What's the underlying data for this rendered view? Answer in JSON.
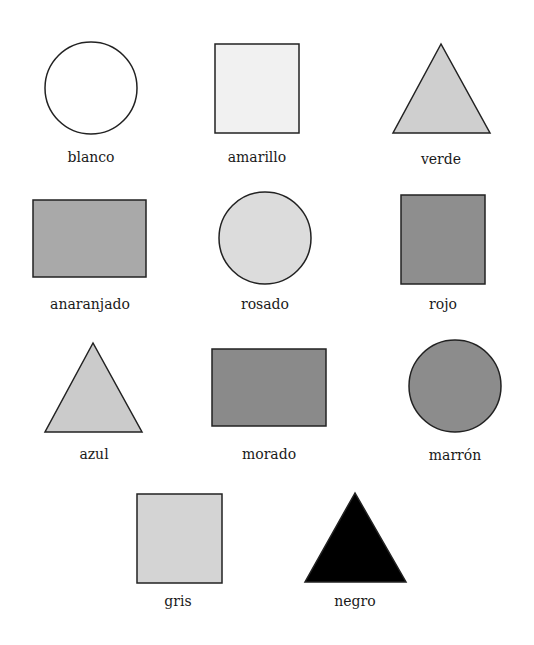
{
  "shapes": [
    {
      "label": "blanco",
      "shape": "circle",
      "fill": "#ffffff",
      "cx": 91,
      "cy": 88,
      "r": 46,
      "label_x": 91,
      "label_y": 149
    },
    {
      "label": "amarillo",
      "shape": "square",
      "fill": "#f1f1f1",
      "x": 215,
      "y": 44,
      "w": 84,
      "h": 89,
      "label_x": 257,
      "label_y": 149
    },
    {
      "label": "verde",
      "shape": "triangle",
      "fill": "#cfcfcf",
      "points": "441,44 393,133 490,133",
      "label_x": 441,
      "label_y": 151
    },
    {
      "label": "anaranjado",
      "shape": "rectangle",
      "fill": "#a9a9a9",
      "x": 33,
      "y": 200,
      "w": 113,
      "h": 77,
      "label_x": 90,
      "label_y": 296
    },
    {
      "label": "rosado",
      "shape": "circle",
      "fill": "#dcdcdc",
      "cx": 265,
      "cy": 238,
      "r": 46,
      "label_x": 265,
      "label_y": 296
    },
    {
      "label": "rojo",
      "shape": "square",
      "fill": "#8e8e8e",
      "x": 401,
      "y": 195,
      "w": 84,
      "h": 89,
      "label_x": 443,
      "label_y": 296
    },
    {
      "label": "azul",
      "shape": "triangle",
      "fill": "#cbcbcb",
      "points": "93,343 45,432 142,432",
      "label_x": 94,
      "label_y": 446
    },
    {
      "label": "morado",
      "shape": "rectangle",
      "fill": "#8a8a8a",
      "x": 212,
      "y": 349,
      "w": 114,
      "h": 77,
      "label_x": 269,
      "label_y": 446
    },
    {
      "label": "marrón",
      "shape": "circle",
      "fill": "#8c8c8c",
      "cx": 455,
      "cy": 386,
      "r": 46,
      "label_x": 455,
      "label_y": 447
    },
    {
      "label": "gris",
      "shape": "square",
      "fill": "#d4d4d4",
      "x": 137,
      "y": 494,
      "w": 85,
      "h": 89,
      "label_x": 178,
      "label_y": 593
    },
    {
      "label": "negro",
      "shape": "triangle",
      "fill": "#000000",
      "points": "355,493 305,582 406,582",
      "label_x": 355,
      "label_y": 593
    }
  ],
  "style": {
    "stroke": "#222222",
    "background": "#ffffff"
  }
}
